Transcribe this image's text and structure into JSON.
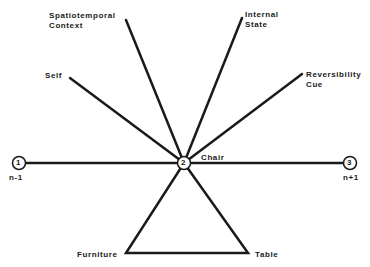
{
  "diagram": {
    "center": {
      "id": "2",
      "label": "Chair"
    },
    "sequence_nodes": [
      {
        "id": "1",
        "label": "n-1"
      },
      {
        "id": "2",
        "label": "Chair"
      },
      {
        "id": "3",
        "label": "n+1"
      }
    ],
    "spokes": [
      {
        "label_line1": "Spatiotemporal",
        "label_line2": "Context"
      },
      {
        "label_line1": "Internal",
        "label_line2": "State"
      },
      {
        "label_line1": "Self",
        "label_line2": ""
      },
      {
        "label_line1": "Reversibility",
        "label_line2": "Cue"
      }
    ],
    "triangle": {
      "left": "Furniture",
      "right": "Table"
    },
    "line_color": "#1a1a1a"
  }
}
